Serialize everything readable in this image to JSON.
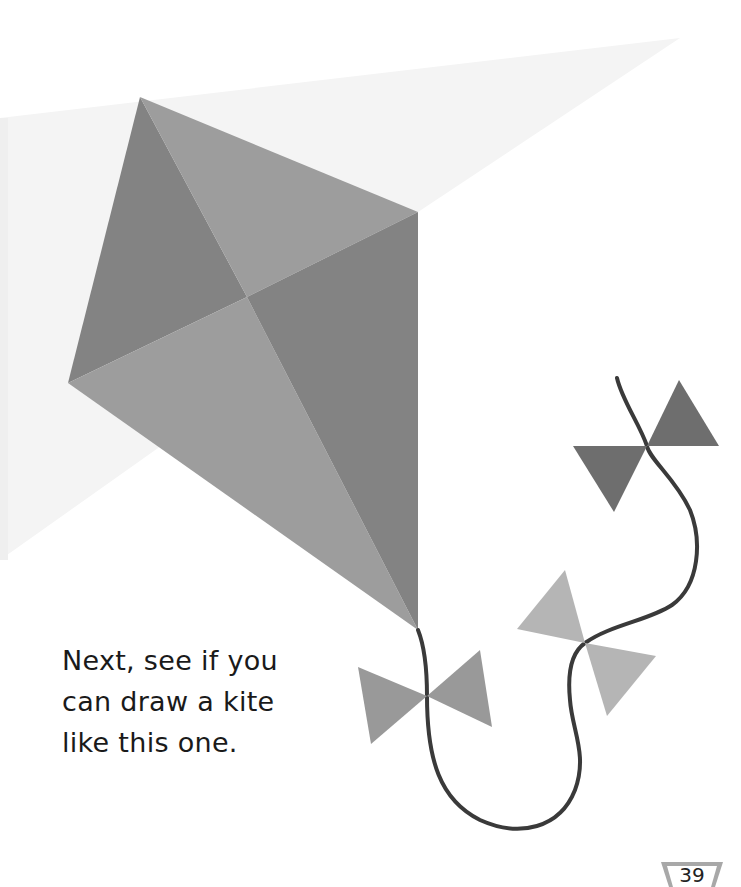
{
  "page": {
    "caption_lines": [
      "Next, see if you",
      "can draw a kite",
      "like this one."
    ],
    "page_number": "39"
  },
  "illustration": {
    "subject": "kite-with-tail",
    "background_wedge_color": "#f3f3f3",
    "kite_light_color": "#9c9c9c",
    "kite_dark_color": "#838383",
    "bow_dark_color": "#6e6e6e",
    "bow_mid_color": "#999999",
    "bow_light_color": "#b3b3b3",
    "string_color": "#3a3a3a",
    "bows": [
      {
        "name": "lower-bow",
        "center": [
          427,
          696
        ]
      },
      {
        "name": "middle-bow",
        "center": [
          585,
          643
        ]
      },
      {
        "name": "top-bow",
        "center": [
          647,
          446
        ]
      }
    ]
  }
}
